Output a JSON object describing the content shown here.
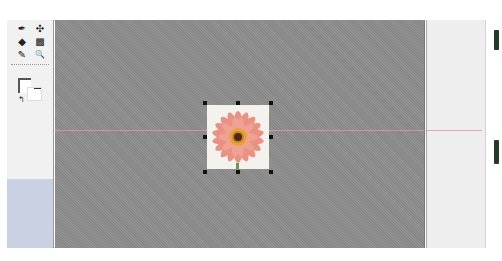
{
  "toolbox": {
    "tools": [
      {
        "name": "pen-tool",
        "glyph": "✒"
      },
      {
        "name": "direct-select-tool",
        "glyph": "✣"
      },
      {
        "name": "fill-tool",
        "glyph": "◆"
      },
      {
        "name": "gradient-tool",
        "glyph": "▩"
      },
      {
        "name": "eyedropper-tool",
        "glyph": "✎"
      },
      {
        "name": "zoom-tool",
        "glyph": "🔍"
      }
    ],
    "swap_glyph": "↰"
  },
  "canvas": {
    "background_color": "#8c8c8c",
    "guide_color": "#e29a92",
    "image": {
      "subject": "pink gerbera daisy",
      "selected": true
    }
  },
  "colors": {
    "toolbox_bg": "#f1f1f1",
    "toolbox_blue": "#c9d1e3",
    "panel_bg": "#eeeeef",
    "side_marker": "#243a22"
  }
}
